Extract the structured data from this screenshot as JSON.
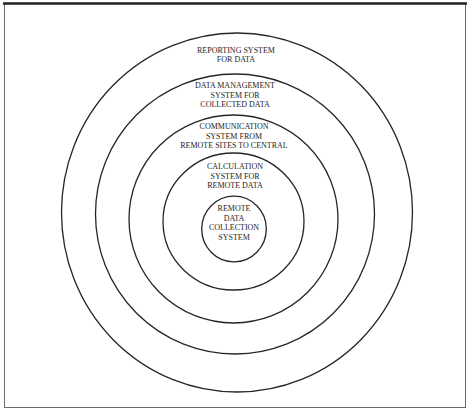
{
  "diagram": {
    "type": "concentric-circles",
    "rings": [
      {
        "level": 1,
        "position": "outermost",
        "label": "REPORTING SYSTEM\nFOR DATA"
      },
      {
        "level": 2,
        "position": "second",
        "label": "DATA MANAGEMENT\nSYSTEM FOR\nCOLLECTED DATA"
      },
      {
        "level": 3,
        "position": "third",
        "label": "COMMUNICATION\nSYSTEM FROM\nREMOTE SITES TO CENTRAL"
      },
      {
        "level": 4,
        "position": "fourth",
        "label": "CALCULATION\nSYSTEM FOR\nREMOTE DATA"
      },
      {
        "level": 5,
        "position": "innermost",
        "label": "REMOTE\nDATA\nCOLLECTION\nSYSTEM"
      }
    ]
  },
  "colors": {
    "background": "#ffffff",
    "stroke": "#262626",
    "frame": "#5a5a5a",
    "text": "#1e1e1e"
  }
}
